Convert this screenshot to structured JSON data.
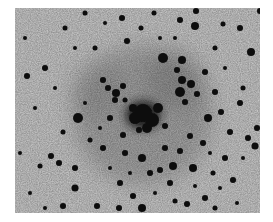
{
  "image": {
    "subject": "negative astronomical photograph of a dense globular star cluster",
    "frame": {
      "x": 15,
      "y": 8,
      "width": 245,
      "height": 205
    },
    "colors": {
      "page": "#ffffff",
      "sky": "#cfcfcf",
      "star": "#0a0a0a",
      "core_haze": "#3a3a3a"
    },
    "core": {
      "cx": 128,
      "cy": 107,
      "rx": 32,
      "ry": 26
    },
    "halos": [
      {
        "cx": 128,
        "cy": 107,
        "r": 70,
        "opacity": 0.18
      },
      {
        "cx": 160,
        "cy": 72,
        "r": 30,
        "opacity": 0.12
      },
      {
        "cx": 80,
        "cy": 80,
        "r": 28,
        "opacity": 0.08
      }
    ],
    "stars": [
      [
        128,
        105,
        9
      ],
      [
        137,
        112,
        7
      ],
      [
        120,
        110,
        6
      ],
      [
        143,
        100,
        5
      ],
      [
        132,
        120,
        5
      ],
      [
        118,
        100,
        4
      ],
      [
        150,
        118,
        3
      ],
      [
        124,
        122,
        3
      ],
      [
        148,
        50,
        5
      ],
      [
        167,
        52,
        4
      ],
      [
        162,
        62,
        3
      ],
      [
        167,
        72,
        4
      ],
      [
        165,
        84,
        5
      ],
      [
        176,
        76,
        4
      ],
      [
        182,
        86,
        3
      ],
      [
        170,
        94,
        3
      ],
      [
        101,
        85,
        4
      ],
      [
        108,
        78,
        3
      ],
      [
        100,
        92,
        3
      ],
      [
        88,
        72,
        3
      ],
      [
        93,
        80,
        3
      ],
      [
        110,
        92,
        2.5
      ],
      [
        63,
        110,
        5
      ],
      [
        48,
        124,
        2.5
      ],
      [
        30,
        60,
        3
      ],
      [
        12,
        68,
        3
      ],
      [
        180,
        18,
        4
      ],
      [
        181,
        3,
        3
      ],
      [
        165,
        12,
        3
      ],
      [
        236,
        44,
        4
      ],
      [
        242,
        120,
        3
      ],
      [
        240,
        138,
        3.5
      ],
      [
        193,
        110,
        4
      ],
      [
        188,
        135,
        3
      ],
      [
        158,
        158,
        4
      ],
      [
        145,
        162,
        3
      ],
      [
        178,
        160,
        4
      ],
      [
        127,
        150,
        4
      ],
      [
        110,
        145,
        3
      ],
      [
        105,
        175,
        3
      ],
      [
        60,
        180,
        3.5
      ],
      [
        48,
        198,
        3
      ],
      [
        172,
        196,
        3
      ],
      [
        190,
        190,
        3
      ],
      [
        140,
        210,
        3
      ],
      [
        104,
        200,
        3
      ],
      [
        127,
        200,
        4
      ],
      [
        82,
        198,
        3
      ],
      [
        95,
        110,
        3
      ],
      [
        108,
        127,
        3
      ],
      [
        200,
        84,
        3
      ],
      [
        206,
        104,
        3
      ],
      [
        215,
        124,
        3
      ],
      [
        210,
        150,
        3
      ],
      [
        198,
        165,
        2.5
      ],
      [
        218,
        172,
        3
      ],
      [
        228,
        80,
        2.5
      ],
      [
        50,
        20,
        2.5
      ],
      [
        80,
        40,
        2.5
      ],
      [
        112,
        33,
        3
      ],
      [
        126,
        20,
        2.5
      ],
      [
        107,
        10,
        3
      ],
      [
        139,
        5,
        2.5
      ],
      [
        225,
        20,
        3
      ],
      [
        208,
        16,
        2.5
      ],
      [
        200,
        40,
        2.5
      ],
      [
        190,
        64,
        3
      ],
      [
        36,
        148,
        3
      ],
      [
        25,
        158,
        2.5
      ],
      [
        60,
        160,
        3
      ],
      [
        44,
        155,
        3
      ],
      [
        75,
        132,
        2.5
      ],
      [
        88,
        140,
        3
      ],
      [
        135,
        165,
        3
      ],
      [
        155,
        175,
        3
      ],
      [
        160,
        193,
        2.5
      ],
      [
        118,
        188,
        3
      ],
      [
        150,
        140,
        3
      ],
      [
        165,
        143,
        3
      ],
      [
        175,
        128,
        3
      ],
      [
        225,
        95,
        3
      ],
      [
        233,
        130,
        3
      ],
      [
        250,
        5,
        4
      ],
      [
        245,
        3,
        3
      ],
      [
        70,
        5,
        2.5
      ],
      [
        10,
        30,
        2
      ],
      [
        20,
        100,
        2
      ],
      [
        5,
        145,
        2
      ],
      [
        15,
        185,
        2
      ],
      [
        30,
        200,
        2
      ],
      [
        200,
        200,
        2.5
      ],
      [
        222,
        195,
        2
      ],
      [
        228,
        150,
        2
      ],
      [
        195,
        145,
        2
      ],
      [
        210,
        60,
        2
      ],
      [
        160,
        30,
        2
      ],
      [
        145,
        30,
        2
      ],
      [
        90,
        15,
        2
      ],
      [
        60,
        40,
        2
      ],
      [
        40,
        80,
        2
      ],
      [
        70,
        95,
        2
      ],
      [
        85,
        120,
        2
      ],
      [
        95,
        160,
        2
      ],
      [
        115,
        165,
        2
      ],
      [
        140,
        185,
        2
      ],
      [
        180,
        178,
        2
      ],
      [
        205,
        180,
        2
      ]
    ]
  }
}
